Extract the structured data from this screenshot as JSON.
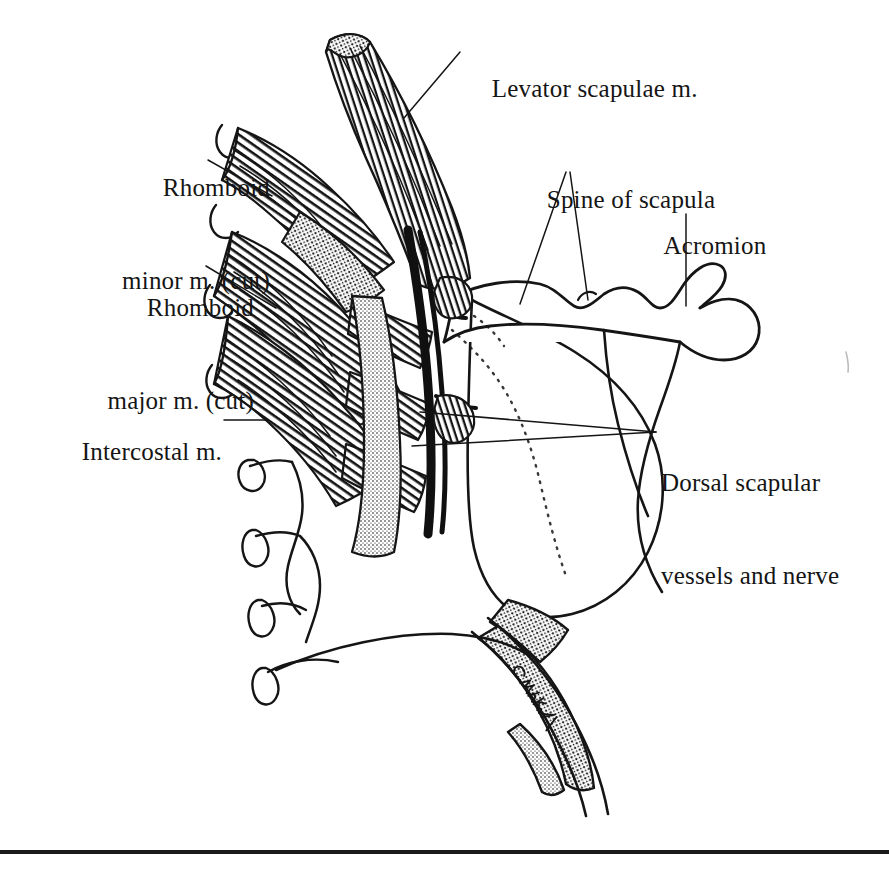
{
  "figure": {
    "kind": "anatomical-line-illustration",
    "signature": "C. Mihalk",
    "ink_color": "#151515",
    "paper_color": "#ffffff"
  },
  "labels": [
    {
      "id": "levator-scapulae",
      "text": "Levator scapulae m.",
      "align": "left",
      "x": 466,
      "y": 42
    },
    {
      "id": "rhomboid-minor",
      "line1": "Rhomboid",
      "line2": "minor m. (cut)",
      "align": "right",
      "x": 40,
      "y": 110
    },
    {
      "id": "spine-of-scapula",
      "text": "Spine of scapula",
      "align": "left",
      "x": 521,
      "y": 153
    },
    {
      "id": "acromion",
      "text": "Acromion",
      "align": "left",
      "x": 639,
      "y": 199
    },
    {
      "id": "rhomboid-major",
      "line1": "Rhomboid",
      "line2": "major m. (cut)",
      "align": "right",
      "x": 24,
      "y": 230
    },
    {
      "id": "intercostal",
      "text": "Intercostal m.",
      "align": "right",
      "x": 26,
      "y": 405
    },
    {
      "id": "dorsal-scapular",
      "line1": "Dorsal scapular",
      "line2": "vessels and nerve",
      "align": "left",
      "x": 661,
      "y": 405
    }
  ],
  "rule": {
    "id": "bottom-rule",
    "y": 852,
    "thickness": 4
  }
}
